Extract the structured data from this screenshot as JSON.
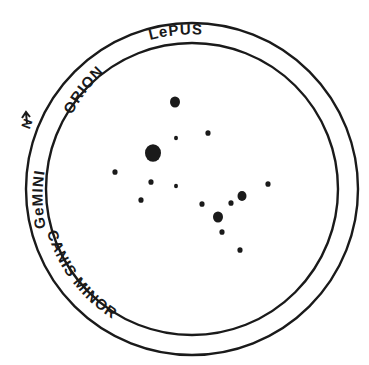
{
  "chart": {
    "center": {
      "x": 192,
      "y": 189
    },
    "outer_radius": 166,
    "inner_radius": 146,
    "stroke_color": "#1a1a1a",
    "labels": [
      {
        "id": "lepus",
        "text": "LePUS",
        "startOffset": "18%"
      },
      {
        "id": "orion",
        "text": "ORION",
        "startOffset": "4%"
      },
      {
        "id": "gemini",
        "text": "GeMINI",
        "startOffset": "0%"
      },
      {
        "id": "canis-minor",
        "text": "CANIS MINOR",
        "startOffset": "0%"
      }
    ],
    "north_marker": {
      "text": "N",
      "icon": "north-arrow-icon"
    },
    "stars": [
      {
        "x": 175,
        "y": 102,
        "r": 5
      },
      {
        "x": 208,
        "y": 133,
        "r": 2.6
      },
      {
        "x": 176,
        "y": 138,
        "r": 2
      },
      {
        "x": 153,
        "y": 153,
        "r": 8
      },
      {
        "x": 115,
        "y": 172,
        "r": 2.6
      },
      {
        "x": 151,
        "y": 182,
        "r": 2.6
      },
      {
        "x": 176,
        "y": 186,
        "r": 2
      },
      {
        "x": 141,
        "y": 200,
        "r": 2.6
      },
      {
        "x": 268,
        "y": 184,
        "r": 2.6
      },
      {
        "x": 242,
        "y": 196,
        "r": 4.5
      },
      {
        "x": 231,
        "y": 203,
        "r": 2.6
      },
      {
        "x": 202,
        "y": 204,
        "r": 2.6
      },
      {
        "x": 218,
        "y": 217,
        "r": 5
      },
      {
        "x": 222,
        "y": 232,
        "r": 2.6
      },
      {
        "x": 240,
        "y": 250,
        "r": 2.6
      }
    ]
  }
}
